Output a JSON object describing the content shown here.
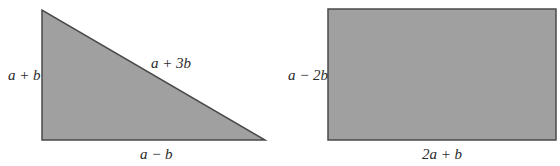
{
  "colors": {
    "shape_fill": "#a0a0a0",
    "shape_stroke": "#4a4a4a",
    "text": "#2a2a2a",
    "background": "#ffffff"
  },
  "figures": [
    {
      "type": "right-triangle",
      "labels": {
        "left_side": "a + b",
        "hypotenuse": "a + 3b",
        "bottom_side": "a − b"
      }
    },
    {
      "type": "rectangle",
      "labels": {
        "left_side": "a − 2b",
        "bottom_side": "2a + b"
      }
    }
  ]
}
